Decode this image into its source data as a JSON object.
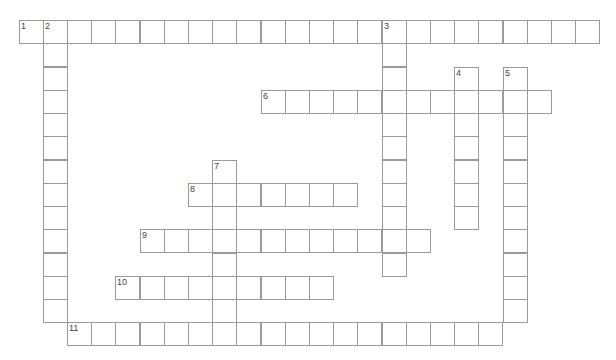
{
  "puzzle": {
    "type": "crossword",
    "grid": {
      "origin_x": 18.5,
      "origin_y": 20,
      "cell_width": 24.2,
      "cell_height": 23.25,
      "border_color": "#9a9a9a",
      "number_color": "#444444"
    },
    "entries": [
      {
        "number": "1",
        "direction": "across",
        "row": 0,
        "col": 1,
        "length": 24,
        "start_col": 0
      },
      {
        "number": "2",
        "direction": "down",
        "row": 0,
        "col": 1,
        "length": 13
      },
      {
        "number": "3",
        "direction": "down",
        "row": 0,
        "col": 15,
        "length": 11
      },
      {
        "number": "4",
        "direction": "down",
        "row": 2,
        "col": 18,
        "length": 7
      },
      {
        "number": "5",
        "direction": "down",
        "row": 2,
        "col": 20,
        "length": 11
      },
      {
        "number": "6",
        "direction": "across",
        "row": 3,
        "col": 10,
        "length": 12
      },
      {
        "number": "7",
        "direction": "down",
        "row": 6,
        "col": 8,
        "length": 8
      },
      {
        "number": "8",
        "direction": "across",
        "row": 7,
        "col": 7,
        "length": 7
      },
      {
        "number": "9",
        "direction": "across",
        "row": 9,
        "col": 5,
        "length": 12
      },
      {
        "number": "10",
        "direction": "across",
        "row": 11,
        "col": 4,
        "length": 9
      },
      {
        "number": "11",
        "direction": "across",
        "row": 13,
        "col": 2,
        "length": 18
      }
    ]
  }
}
